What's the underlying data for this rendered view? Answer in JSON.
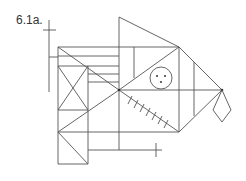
{
  "figure": {
    "label": "6.1a.",
    "stroke_color": "#555555",
    "background": "#ffffff"
  },
  "elements": {
    "circle": {
      "description": "circle with three dots",
      "dots": 3
    },
    "hatch_marks": {
      "count": 7
    },
    "diamond": {
      "description": "diamond hanging from right node"
    },
    "crosses": {
      "count": 2
    }
  }
}
